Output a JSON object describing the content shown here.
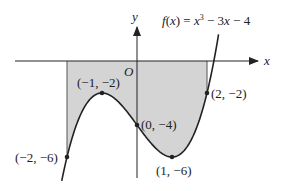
{
  "figure": {
    "function_label": "f(x) = x³ − 3x − 4",
    "function_parts": {
      "f": "f",
      "paren_x": "(x) = ",
      "x": "x",
      "exp": "3",
      "rest": " − 3x − 4"
    },
    "axis_x_label": "x",
    "axis_y_label": "y",
    "origin_label": "O",
    "points": [
      {
        "label": "(−2, −6)",
        "x": -2,
        "y": -6
      },
      {
        "label": "(−1, −2)",
        "x": -1,
        "y": -2
      },
      {
        "label": "(0, −4)",
        "x": 0,
        "y": -4
      },
      {
        "label": "(1, −6)",
        "x": 1,
        "y": -6
      },
      {
        "label": "(2, −2)",
        "x": 2,
        "y": -2
      }
    ],
    "shaded_region": {
      "x_from": -2,
      "x_to": 2,
      "between": "curve and x-axis"
    },
    "colors": {
      "shade": "#d4d4d4",
      "line": "#222222"
    }
  }
}
